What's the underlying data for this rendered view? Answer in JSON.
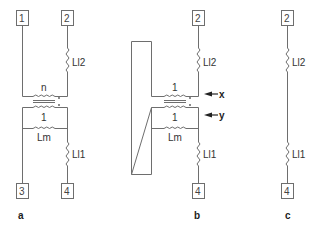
{
  "diagram": {
    "type": "transformer equivalent circuit",
    "panels": [
      {
        "id": "a",
        "label": "a",
        "terminals": [
          "1",
          "2",
          "3",
          "4"
        ],
        "components": {
          "ratio_top": "n",
          "ratio_bottom": "1",
          "magnetizing": "Lm",
          "leakage_top": "Ll2",
          "leakage_bottom": "Ll1"
        }
      },
      {
        "id": "b",
        "label": "b",
        "terminals": [
          "2",
          "4"
        ],
        "components": {
          "ratio_top": "1",
          "ratio_bottom": "1",
          "magnetizing": "Lm",
          "leakage_top": "Ll2",
          "leakage_bottom": "Ll1"
        },
        "arrows": [
          "x",
          "y"
        ]
      },
      {
        "id": "c",
        "label": "c",
        "terminals": [
          "2",
          "4"
        ],
        "components": {
          "leakage_top": "Ll2",
          "leakage_bottom": "Ll1"
        }
      }
    ],
    "colors": {
      "wire": "#6e6e6e",
      "text": "#333333"
    }
  }
}
